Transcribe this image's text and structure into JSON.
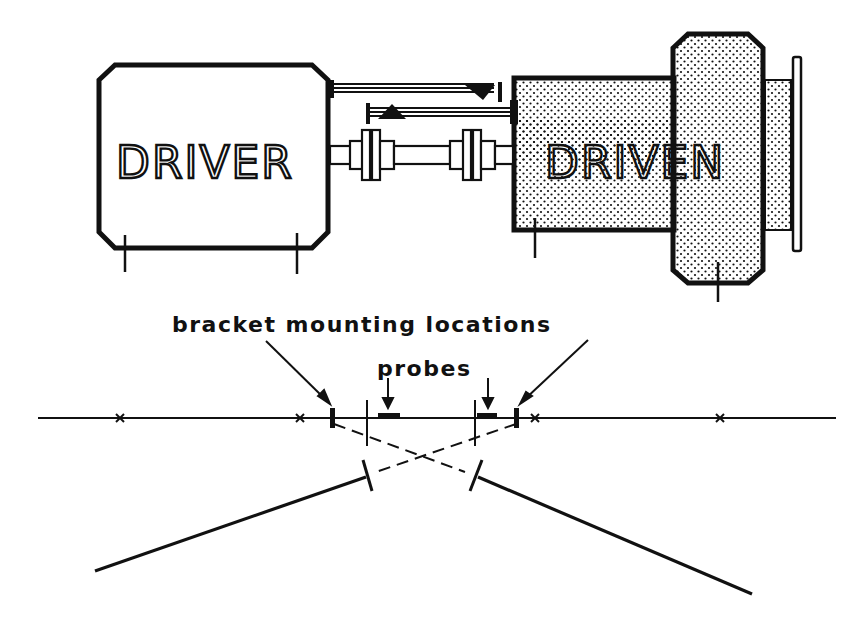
{
  "diagram": {
    "type": "shaft alignment (reverse dial / bracket) setup",
    "machines": {
      "driver": {
        "label": "DRIVER"
      },
      "driven": {
        "label": "DRIVEN"
      }
    },
    "annotations": {
      "bracket_label": "bracket mounting locations",
      "probes_label": "probes"
    },
    "colors": {
      "ink": "#111111",
      "background": "#ffffff",
      "stipple": "#111111"
    }
  }
}
